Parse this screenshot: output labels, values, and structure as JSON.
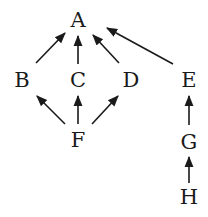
{
  "diagram": {
    "type": "directed-graph",
    "colors": {
      "ink": "#1a1a1a",
      "background": "#ffffff"
    },
    "nodes": [
      {
        "id": "A",
        "label": "A",
        "x": 78,
        "y": 20
      },
      {
        "id": "B",
        "label": "B",
        "x": 22,
        "y": 80
      },
      {
        "id": "C",
        "label": "C",
        "x": 78,
        "y": 80
      },
      {
        "id": "D",
        "label": "D",
        "x": 131,
        "y": 80
      },
      {
        "id": "E",
        "label": "E",
        "x": 189,
        "y": 80
      },
      {
        "id": "F",
        "label": "F",
        "x": 78,
        "y": 140
      },
      {
        "id": "G",
        "label": "G",
        "x": 189,
        "y": 142
      },
      {
        "id": "H",
        "label": "H",
        "x": 189,
        "y": 197
      }
    ],
    "edges": [
      {
        "from": "B",
        "to": "A"
      },
      {
        "from": "C",
        "to": "A"
      },
      {
        "from": "D",
        "to": "A"
      },
      {
        "from": "E",
        "to": "A"
      },
      {
        "from": "F",
        "to": "B"
      },
      {
        "from": "F",
        "to": "C"
      },
      {
        "from": "F",
        "to": "D"
      },
      {
        "from": "G",
        "to": "E"
      },
      {
        "from": "H",
        "to": "G"
      }
    ]
  }
}
